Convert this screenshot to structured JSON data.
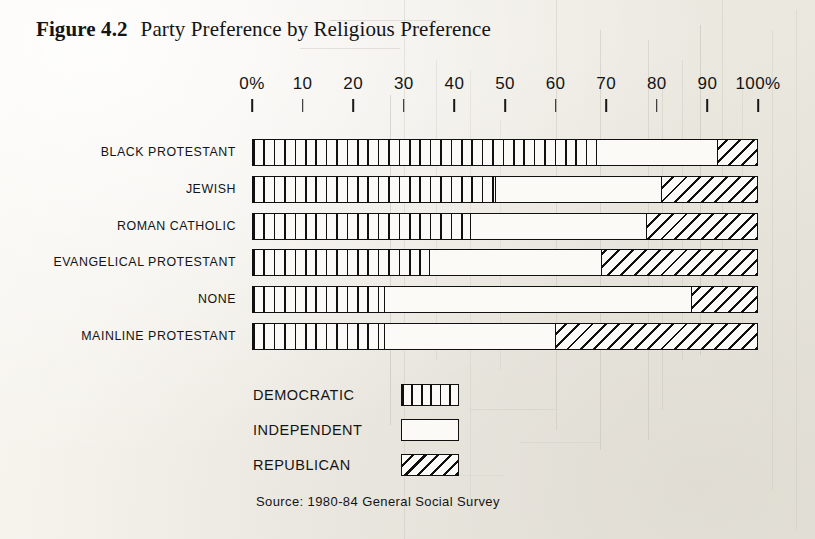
{
  "figure": {
    "number_label": "Figure 4.2",
    "title": "Party Preference by Religious Preference",
    "source": "Source: 1980-84 General Social Survey"
  },
  "legend": {
    "items": [
      {
        "label": "DEMOCRATIC",
        "pattern": "vertical-stripes"
      },
      {
        "label": "INDEPENDENT",
        "pattern": "empty"
      },
      {
        "label": "REPUBLICAN",
        "pattern": "diagonal-hatch"
      }
    ]
  },
  "chart_data": {
    "type": "bar",
    "orientation": "horizontal",
    "stacked": true,
    "stacked_normalized": true,
    "title": "Party Preference by Religious Preference",
    "xlabel": "",
    "ylabel": "",
    "xlim": [
      0,
      100
    ],
    "xtick_labels": [
      "0%",
      "10",
      "20",
      "30",
      "40",
      "50",
      "60",
      "70",
      "80",
      "90",
      "100%"
    ],
    "xticks": [
      0,
      10,
      20,
      30,
      40,
      50,
      60,
      70,
      80,
      90,
      100
    ],
    "grid": false,
    "legend_position": "below-left",
    "units": "percent",
    "categories": [
      "BLACK PROTESTANT",
      "JEWISH",
      "ROMAN CATHOLIC",
      "EVANGELICAL PROTESTANT",
      "NONE",
      "MAINLINE PROTESTANT"
    ],
    "series": [
      {
        "name": "DEMOCRATIC",
        "values": [
          68,
          48,
          43,
          35,
          26,
          26
        ]
      },
      {
        "name": "INDEPENDENT",
        "values": [
          24,
          33,
          35,
          34,
          61,
          34
        ]
      },
      {
        "name": "REPUBLICAN",
        "values": [
          8,
          19,
          22,
          31,
          13,
          40
        ]
      }
    ],
    "rows": [
      {
        "category": "BLACK PROTESTANT",
        "democratic": 68,
        "independent": 24,
        "republican": 8
      },
      {
        "category": "JEWISH",
        "democratic": 48,
        "independent": 33,
        "republican": 19
      },
      {
        "category": "ROMAN CATHOLIC",
        "democratic": 43,
        "independent": 35,
        "republican": 22
      },
      {
        "category": "EVANGELICAL PROTESTANT",
        "democratic": 35,
        "independent": 34,
        "republican": 31
      },
      {
        "category": "NONE",
        "democratic": 26,
        "independent": 61,
        "republican": 13
      },
      {
        "category": "MAINLINE PROTESTANT",
        "democratic": 26,
        "independent": 34,
        "republican": 40
      }
    ]
  },
  "colors": {
    "ink": "#101010",
    "paper": "#f2f0ea"
  }
}
